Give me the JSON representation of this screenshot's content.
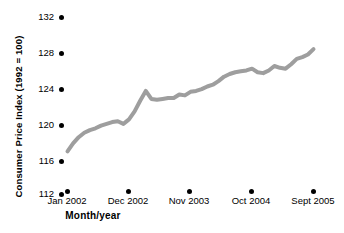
{
  "chart_data": {
    "type": "line",
    "title": "",
    "subtitle": "",
    "xlabel": "Month/year",
    "ylabel": "Consumer Price Index (1992 = 100)",
    "ylim": [
      112,
      132
    ],
    "ytick_labels": [
      "112",
      "116",
      "120",
      "124",
      "128",
      "132"
    ],
    "ytick_values": [
      112,
      116,
      120,
      124,
      128,
      132
    ],
    "xtick_labels": [
      "Jan 2002",
      "Dec 2002",
      "Nov 2003",
      "Oct 2004",
      "Sept 2005"
    ],
    "xtick_months": [
      "Jan 2002",
      "Dec 2002",
      "Nov 2003",
      "Oct 2004",
      "Sept 2005"
    ],
    "grid": false,
    "legend": "none",
    "line_color": "#9e9e9e",
    "line_width": 4,
    "series": [
      {
        "name": "Consumer Price Index",
        "x": [
          "Jan 2002",
          "Feb 2002",
          "Mar 2002",
          "Apr 2002",
          "May 2002",
          "Jun 2002",
          "Jul 2002",
          "Aug 2002",
          "Sept 2002",
          "Oct 2002",
          "Nov 2002",
          "Dec 2002",
          "Jan 2003",
          "Feb 2003",
          "Mar 2003",
          "Apr 2003",
          "May 2003",
          "Jun 2003",
          "Jul 2003",
          "Aug 2003",
          "Sept 2003",
          "Oct 2003",
          "Nov 2003",
          "Dec 2003",
          "Jan 2004",
          "Feb 2004",
          "Mar 2004",
          "Apr 2004",
          "May 2004",
          "Jun 2004",
          "Jul 2004",
          "Aug 2004",
          "Sept 2004",
          "Oct 2004",
          "Nov 2004",
          "Dec 2004",
          "Jan 2005",
          "Feb 2005",
          "Mar 2005",
          "Apr 2005",
          "May 2005",
          "Jun 2005",
          "Jul 2005",
          "Aug 2005",
          "Sept 2005"
        ],
        "values": [
          116.5,
          117.4,
          118.1,
          118.6,
          118.9,
          119.1,
          119.4,
          119.6,
          119.8,
          119.9,
          119.6,
          120.1,
          121.0,
          122.2,
          123.3,
          122.4,
          122.3,
          122.4,
          122.5,
          122.5,
          122.9,
          122.8,
          123.2,
          123.3,
          123.5,
          123.8,
          124.0,
          124.4,
          124.9,
          125.2,
          125.4,
          125.5,
          125.6,
          125.8,
          125.4,
          125.3,
          125.6,
          126.1,
          125.9,
          125.8,
          126.3,
          126.9,
          127.1,
          127.4,
          128.0
        ]
      }
    ]
  },
  "axis": {
    "y_title": "Consumer Price Index (1992 = 100)",
    "x_title": "Month/year"
  }
}
